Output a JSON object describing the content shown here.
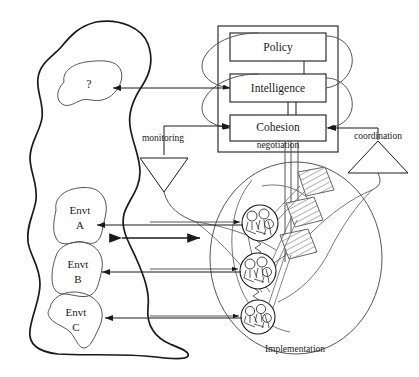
{
  "diagram": {
    "title_note": "Viable System Model style diagram",
    "system_boxes": [
      {
        "id": "policy",
        "label": "Policy"
      },
      {
        "id": "intelligence",
        "label": "Intelligence"
      },
      {
        "id": "cohesion",
        "label": "Cohesion"
      }
    ],
    "channel_labels": [
      {
        "id": "monitoring",
        "label": "monitoring"
      },
      {
        "id": "negotiation",
        "label": "negotiation"
      },
      {
        "id": "coordination",
        "label": "coordination"
      }
    ],
    "implementation_label": "Implementation",
    "unknown_marker": "?",
    "environments": [
      {
        "id": "envt-a",
        "line1": "Envt",
        "line2": "A"
      },
      {
        "id": "envt-b",
        "line1": "Envt",
        "line2": "B"
      },
      {
        "id": "envt-c",
        "line1": "Envt",
        "line2": "C"
      }
    ],
    "colors": {
      "stroke": "#1a1a1a",
      "thin_stroke": "#444444",
      "background": "#ffffff",
      "text": "#1a1a1a"
    },
    "icons": {
      "monitoring_triangle": "triangle-down-icon",
      "coordination_triangle": "triangle-up-icon",
      "node_cluster": "agent-cluster-icon",
      "ladder": "hatched-ladder-icon"
    }
  }
}
